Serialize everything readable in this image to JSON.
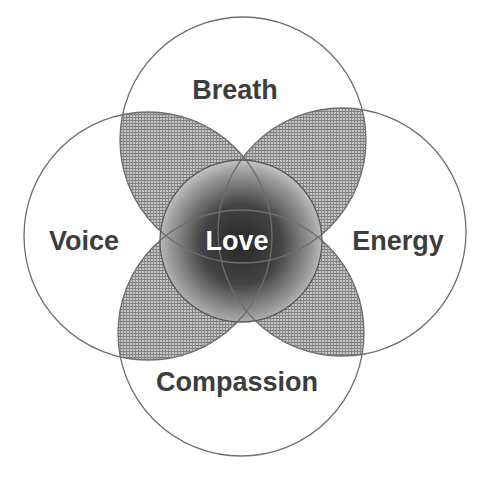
{
  "diagram": {
    "type": "venn-flower",
    "outer_circles": [
      {
        "id": "breath",
        "label": "Breath",
        "cx": 243,
        "cy": 140,
        "r": 123,
        "label_x": 235,
        "label_y": 99
      },
      {
        "id": "voice",
        "label": "Voice",
        "cx": 148,
        "cy": 236,
        "r": 124,
        "label_x": 84,
        "label_y": 250
      },
      {
        "id": "energy",
        "label": "Energy",
        "cx": 342,
        "cy": 232,
        "r": 124,
        "label_x": 398,
        "label_y": 250
      },
      {
        "id": "compassion",
        "label": "Compassion",
        "cx": 241,
        "cy": 333,
        "r": 123,
        "label_x": 237,
        "label_y": 391
      }
    ],
    "center_circle": {
      "id": "love",
      "label": "Love",
      "cx": 241,
      "cy": 241,
      "r": 81,
      "label_x": 237,
      "label_y": 250
    },
    "colors": {
      "stroke": "#6e6e6e",
      "hatch_bg": "#b8b8b8",
      "hatch_line": "#7a7a7a",
      "center_dark": "#2e2e2e",
      "center_light": "#d6d6d6",
      "label_text": "#3d3d3d",
      "center_text": "#ffffff"
    }
  }
}
